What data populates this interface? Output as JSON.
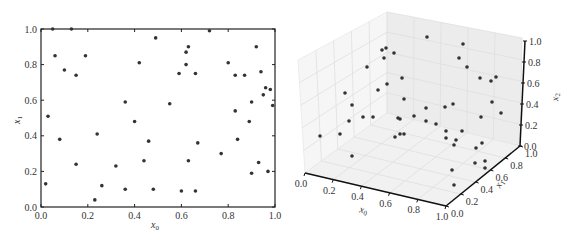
{
  "chart_data": [
    {
      "type": "scatter",
      "title": "",
      "xlabel": "x_0",
      "ylabel": "x_1",
      "xlim": [
        0.0,
        1.0
      ],
      "ylim": [
        0.0,
        1.0
      ],
      "xticks": [
        "0.0",
        "0.2",
        "0.4",
        "0.6",
        "0.8",
        "1.0"
      ],
      "yticks": [
        "0.0",
        "0.2",
        "0.4",
        "0.6",
        "0.8",
        "1.0"
      ],
      "grid": false,
      "legend": null,
      "marker_color": "#333333",
      "points": [
        [
          0.02,
          0.13
        ],
        [
          0.03,
          0.51
        ],
        [
          0.06,
          0.85
        ],
        [
          0.08,
          0.38
        ],
        [
          0.1,
          0.77
        ],
        [
          0.15,
          0.74
        ],
        [
          0.15,
          0.24
        ],
        [
          0.19,
          0.85
        ],
        [
          0.13,
          1.0
        ],
        [
          0.05,
          1.0
        ],
        [
          0.23,
          0.04
        ],
        [
          0.24,
          0.41
        ],
        [
          0.26,
          0.12
        ],
        [
          0.32,
          0.23
        ],
        [
          0.36,
          0.59
        ],
        [
          0.36,
          0.1
        ],
        [
          0.4,
          0.48
        ],
        [
          0.42,
          0.81
        ],
        [
          0.44,
          0.26
        ],
        [
          0.46,
          0.37
        ],
        [
          0.48,
          0.1
        ],
        [
          0.49,
          0.95
        ],
        [
          0.55,
          0.58
        ],
        [
          0.59,
          0.75
        ],
        [
          0.6,
          0.09
        ],
        [
          0.62,
          0.87
        ],
        [
          0.62,
          0.8
        ],
        [
          0.63,
          0.26
        ],
        [
          0.63,
          0.9
        ],
        [
          0.66,
          0.09
        ],
        [
          0.66,
          0.75
        ],
        [
          0.67,
          0.36
        ],
        [
          0.72,
          0.99
        ],
        [
          0.77,
          0.3
        ],
        [
          0.8,
          0.81
        ],
        [
          0.83,
          0.74
        ],
        [
          0.83,
          0.54
        ],
        [
          0.84,
          0.38
        ],
        [
          0.87,
          0.74
        ],
        [
          0.89,
          0.48
        ],
        [
          0.9,
          0.19
        ],
        [
          0.9,
          0.59
        ],
        [
          0.92,
          0.9
        ],
        [
          0.93,
          0.25
        ],
        [
          0.94,
          0.76
        ],
        [
          0.95,
          0.63
        ],
        [
          0.96,
          0.67
        ],
        [
          0.97,
          0.2
        ],
        [
          0.98,
          0.66
        ],
        [
          0.99,
          0.57
        ]
      ]
    },
    {
      "type": "scatter3d",
      "title": "",
      "xlabel": "x_0",
      "ylabel": "x_1",
      "zlabel": "x_2",
      "xlim": [
        0.0,
        1.0
      ],
      "ylim": [
        0.0,
        1.0
      ],
      "zlim": [
        0.0,
        1.0
      ],
      "xticks": [
        "0.0",
        "0.2",
        "0.4",
        "0.6",
        "0.8",
        "1.0"
      ],
      "yticks": [
        "0.0",
        "0.2",
        "0.4",
        "0.6",
        "0.8",
        "1.0"
      ],
      "zticks": [
        "0.0",
        "0.2",
        "0.4",
        "0.6",
        "0.8",
        "1.0"
      ],
      "grid": true,
      "legend": null,
      "marker_color": "#333333",
      "screen_points": [
        [
          427,
          37
        ],
        [
          463,
          44
        ],
        [
          459,
          58
        ],
        [
          467,
          67
        ],
        [
          480,
          78
        ],
        [
          491,
          81
        ],
        [
          496,
          77
        ],
        [
          382,
          50
        ],
        [
          386,
          48
        ],
        [
          384,
          58
        ],
        [
          394,
          53
        ],
        [
          367,
          67
        ],
        [
          402,
          78
        ],
        [
          378,
          90
        ],
        [
          387,
          84
        ],
        [
          345,
          93
        ],
        [
          352,
          105
        ],
        [
          404,
          99
        ],
        [
          349,
          121
        ],
        [
          363,
          117
        ],
        [
          373,
          117
        ],
        [
          398,
          118
        ],
        [
          400,
          119
        ],
        [
          414,
          116
        ],
        [
          426,
          108
        ],
        [
          426,
          121
        ],
        [
          436,
          124
        ],
        [
          445,
          107
        ],
        [
          453,
          104
        ],
        [
          481,
          117
        ],
        [
          492,
          102
        ],
        [
          501,
          113
        ],
        [
          320,
          136
        ],
        [
          340,
          134
        ],
        [
          395,
          137
        ],
        [
          400,
          134
        ],
        [
          404,
          134
        ],
        [
          446,
          131
        ],
        [
          446,
          138
        ],
        [
          456,
          140
        ],
        [
          454,
          145
        ],
        [
          462,
          131
        ],
        [
          476,
          148
        ],
        [
          482,
          143
        ],
        [
          475,
          163
        ],
        [
          485,
          161
        ],
        [
          485,
          168
        ],
        [
          452,
          170
        ],
        [
          454,
          185
        ],
        [
          352,
          156
        ]
      ]
    }
  ]
}
